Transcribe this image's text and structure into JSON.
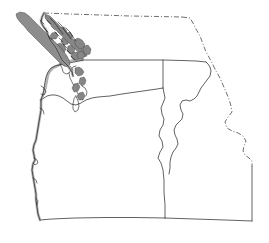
{
  "map": {
    "title": "Pacific Northwest Outline Map",
    "projection": "geographic",
    "background_color": "#ffffff",
    "line_color": "#2b2b2b",
    "coast_shadow_color": "#9a9a9a",
    "island_fill_color": "#8d8d8d",
    "border_style_international": "dash-dot",
    "border_style_state": "solid",
    "width_px": 269,
    "height_px": 243,
    "regions": [
      {
        "name": "british-columbia",
        "label": "British Columbia",
        "position": "north",
        "border_type": "dash-dot",
        "visible_portion": "southern"
      },
      {
        "name": "washington",
        "label": "Washington",
        "position": "northwest",
        "border_type": "solid",
        "features": [
          "puget-sound",
          "olympic-peninsula",
          "columbia-river"
        ]
      },
      {
        "name": "oregon",
        "label": "Oregon",
        "position": "southwest",
        "border_type": "solid",
        "features": [
          "pacific-coast",
          "snake-river"
        ]
      },
      {
        "name": "idaho",
        "label": "Idaho",
        "position": "east",
        "border_type": "solid",
        "features": [
          "panhandle",
          "bitterroot-range"
        ]
      }
    ],
    "features": [
      {
        "name": "vancouver-island",
        "type": "island",
        "fill": "#8d8d8d"
      },
      {
        "name": "queen-charlotte-sound",
        "type": "water"
      },
      {
        "name": "strait-of-georgia",
        "type": "water"
      },
      {
        "name": "puget-sound",
        "type": "water"
      },
      {
        "name": "olympic-peninsula",
        "type": "peninsula"
      },
      {
        "name": "pacific-ocean",
        "type": "ocean"
      },
      {
        "name": "columbia-river",
        "type": "river-border"
      },
      {
        "name": "snake-river",
        "type": "river-border"
      },
      {
        "name": "forty-ninth-parallel",
        "type": "international-border"
      },
      {
        "name": "bitterroot-range",
        "type": "mountain-border"
      }
    ]
  }
}
